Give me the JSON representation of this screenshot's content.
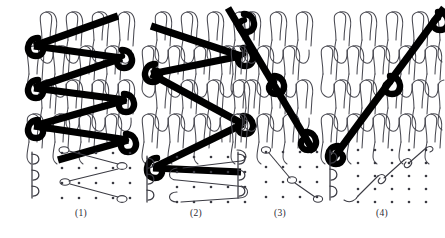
{
  "figure": {
    "background": "#ffffff",
    "ink_color": "#000000",
    "loop_color": "#4a4a52",
    "caption_color": "#2a2a33",
    "width": 445,
    "height": 238
  },
  "panels": [
    {
      "id": "panel-1",
      "caption": "(1)",
      "x": 22,
      "caption_x": 22,
      "caption_width": 118,
      "caption_y": 208,
      "structure": {
        "name": "loop-structure-diagram",
        "wales": 4,
        "courses": 4,
        "loop_cols_x": [
          14,
          40,
          66,
          92
        ],
        "loop_rows_y": [
          16,
          50,
          84,
          118
        ],
        "row_offset_x": 13
      },
      "underlap": {
        "name": "zigzag-three-needle-lapping",
        "description": "thick black zigzag bars traversing three wales with looped knots at turning points",
        "bar_points": [
          [
            8,
            44
          ],
          [
            88,
            16
          ],
          [
            8,
            80
          ],
          [
            88,
            52
          ],
          [
            8,
            116
          ],
          [
            88,
            88
          ],
          [
            8,
            152
          ],
          [
            96,
            124
          ]
        ],
        "knot_points": [
          [
            8,
            44
          ],
          [
            8,
            80
          ],
          [
            8,
            116
          ],
          [
            88,
            52
          ],
          [
            88,
            88
          ],
          [
            96,
            124
          ]
        ]
      },
      "lapping": {
        "name": "lapping-diagram",
        "grid_cols": 5,
        "grid_rows": 4,
        "grid_x": 40,
        "grid_y": 150,
        "col_step": 17,
        "row_step": 15,
        "needle_count": 3,
        "needle_x": 22,
        "needle_y": 150,
        "needle_step": 19,
        "path_note": "zigzag movement across three needle spaces per course"
      }
    },
    {
      "id": "panel-2",
      "caption": "(2)",
      "x": 137,
      "caption_x": 137,
      "caption_width": 118,
      "caption_y": 208,
      "structure": {
        "name": "loop-structure-diagram",
        "wales": 4,
        "courses": 4,
        "loop_cols_x": [
          14,
          40,
          66,
          92
        ],
        "loop_rows_y": [
          16,
          50,
          84,
          118
        ],
        "row_offset_x": 13
      },
      "underlap": {
        "name": "zigzag-three-needle-lapping-mirrored",
        "description": "mirrored Z zigzag bars with heavy circular knots at the return points",
        "bar_points": [
          [
            8,
            60
          ],
          [
            96,
            42
          ],
          [
            8,
            60
          ],
          [
            96,
            122
          ],
          [
            8,
            166
          ],
          [
            96,
            122
          ]
        ],
        "knot_points": [
          [
            8,
            60
          ],
          [
            96,
            42
          ],
          [
            96,
            122
          ],
          [
            8,
            166
          ]
        ]
      },
      "lapping": {
        "name": "lapping-diagram",
        "grid_cols": 5,
        "grid_rows": 4,
        "grid_x": 40,
        "grid_y": 150,
        "col_step": 17,
        "row_step": 15,
        "needle_count": 3,
        "needle_x": 22,
        "needle_y": 150,
        "needle_step": 19,
        "path_note": "wide looping traverse returning to the same needle line"
      }
    },
    {
      "id": "panel-3",
      "caption": "(3)",
      "x": 236,
      "caption_x": 230,
      "caption_width": 100,
      "caption_y": 208,
      "structure": {
        "name": "loop-structure-diagram",
        "wales": 3,
        "courses": 4,
        "loop_cols_x": [
          10,
          36,
          62
        ],
        "loop_rows_y": [
          16,
          50,
          84,
          118
        ],
        "row_offset_x": 13
      },
      "underlap": {
        "name": "descending-diagonal-lapping",
        "description": "single straight descending diagonal bar with three knots",
        "bar_points": [
          [
            -4,
            12
          ],
          [
            78,
            150
          ]
        ],
        "knot_points": [
          [
            2,
            22
          ],
          [
            40,
            86
          ],
          [
            74,
            142
          ]
        ]
      },
      "lapping": {
        "name": "lapping-diagram",
        "grid_cols": 4,
        "grid_rows": 4,
        "grid_x": 36,
        "grid_y": 150,
        "col_step": 17,
        "row_step": 15,
        "needle_count": 3,
        "needle_x": 18,
        "needle_y": 150,
        "needle_step": 19,
        "path_note": "straight diagonal traverse one needle per course"
      }
    },
    {
      "id": "panel-4",
      "caption": "(4)",
      "x": 330,
      "caption_x": 322,
      "caption_width": 118,
      "caption_y": 208,
      "structure": {
        "name": "loop-structure-diagram",
        "wales": 5,
        "courses": 4,
        "loop_cols_x": [
          8,
          34,
          60,
          86,
          112
        ],
        "loop_rows_y": [
          16,
          50,
          84,
          118
        ],
        "row_offset_x": 13
      },
      "underlap": {
        "name": "ascending-diagonal-lapping",
        "description": "single straight ascending diagonal bar from lower-left to upper-right",
        "bar_points": [
          [
            4,
            152
          ],
          [
            116,
            14
          ]
        ],
        "knot_points": [
          [
            8,
            148
          ],
          [
            62,
            84
          ],
          [
            112,
            20
          ]
        ]
      },
      "lapping": {
        "name": "lapping-diagram",
        "grid_cols": 5,
        "grid_rows": 5,
        "grid_x": 36,
        "grid_y": 148,
        "col_step": 17,
        "row_step": 13,
        "needle_count": 3,
        "needle_x": 18,
        "needle_y": 148,
        "needle_step": 19,
        "path_note": "stepped ascending traverse, one needle per course"
      }
    }
  ]
}
